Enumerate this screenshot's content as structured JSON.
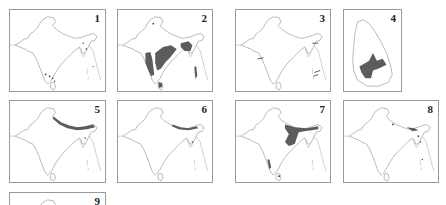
{
  "figure": {
    "colors": {
      "range_fill": "#5c5c5c",
      "outline": "#9c9c9c",
      "border": "#9a9a9a",
      "background": "#ffffff"
    },
    "panels": [
      {
        "label": "1",
        "region": "South Asia",
        "range": "scattered localities, southern Western Ghats, Sri Lanka, NE India, Andamans"
      },
      {
        "label": "2",
        "region": "South Asia",
        "range": "central India, Western Ghats, NE India, Sri Lanka, Andamans (shaded)"
      },
      {
        "label": "3",
        "region": "South Asia",
        "range": "few localities marked with arrows (W India, NE India, Andamans)"
      },
      {
        "label": "4",
        "region": "Sri Lanka",
        "range": "central hill zone (shaded)"
      },
      {
        "label": "5",
        "region": "South Asia",
        "range": "Himalayan belt, NE India"
      },
      {
        "label": "6",
        "region": "South Asia",
        "range": "central/eastern Himalaya, NE India"
      },
      {
        "label": "7",
        "region": "South Asia",
        "range": "Himalaya, NE India, eastern plains, Western Ghats, Sri Lanka"
      },
      {
        "label": "8",
        "region": "South Asia",
        "range": "eastern Himalaya, NE India, Andamans"
      },
      {
        "label": "9",
        "region": "South Asia",
        "range": "partially visible (cropped)"
      }
    ]
  }
}
